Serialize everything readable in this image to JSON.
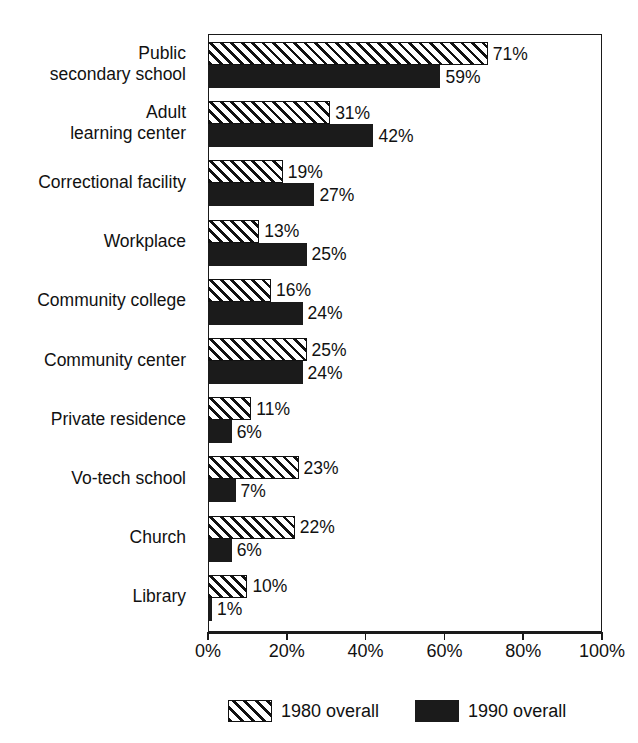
{
  "figure": {
    "title_remnant": "",
    "background": "#ffffff",
    "ink_color": "#111111"
  },
  "axis": {
    "ticks": [
      "0%",
      "20%",
      "40%",
      "60%",
      "80%",
      "100%"
    ],
    "tick_values": [
      0,
      20,
      40,
      60,
      80,
      100
    ]
  },
  "legend": {
    "entries": [
      {
        "label": "1980 overall",
        "pattern": "diagonal-hatch",
        "color": "#ffffff"
      },
      {
        "label": "1990 overall",
        "pattern": "solid",
        "color": "#1b1b1b"
      }
    ]
  },
  "chart_data": {
    "type": "bar",
    "orientation": "horizontal",
    "title": "",
    "xlabel": "",
    "ylabel": "",
    "xlim": [
      0,
      100
    ],
    "grid": false,
    "legend_position": "bottom",
    "categories": [
      "Public\nsecondary school",
      "Adult\nlearning center",
      "Correctional facility",
      "Workplace",
      "Community college",
      "Community center",
      "Private residence",
      "Vo-tech school",
      "Church",
      "Library"
    ],
    "series": [
      {
        "name": "1980 overall",
        "values": [
          71,
          31,
          19,
          13,
          16,
          25,
          11,
          23,
          22,
          10
        ],
        "labels": [
          "71%",
          "31%",
          "19%",
          "13%",
          "16%",
          "25%",
          "11%",
          "23%",
          "22%",
          "10%"
        ]
      },
      {
        "name": "1990 overall",
        "values": [
          59,
          42,
          27,
          25,
          24,
          24,
          6,
          7,
          6,
          1
        ],
        "labels": [
          "59%",
          "42%",
          "27%",
          "25%",
          "24%",
          "24%",
          "6%",
          "7%",
          "6%",
          "1%"
        ]
      }
    ]
  }
}
